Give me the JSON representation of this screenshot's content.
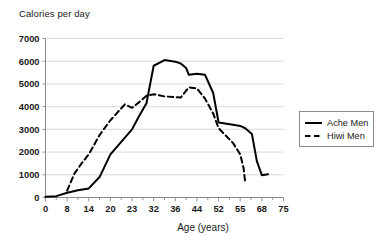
{
  "chart_data": {
    "type": "line",
    "title": "",
    "xlabel": "Age (years)",
    "ylabel": "Calories per day",
    "grid": true,
    "legend_position": "right",
    "ylim": [
      0,
      7000
    ],
    "ytick_step": 1000,
    "yticks": [
      "0",
      "1000",
      "2000",
      "3000",
      "4000",
      "5000",
      "6000",
      "7000"
    ],
    "categories": [
      "0",
      "8",
      "14",
      "20",
      "23",
      "32",
      "36",
      "44",
      "52",
      "55",
      "68",
      "75"
    ],
    "x": [
      0,
      4,
      6,
      8,
      10,
      12,
      14,
      16,
      18,
      20,
      23,
      26,
      29,
      32,
      34,
      36,
      38,
      40,
      41,
      44,
      47,
      50,
      52,
      54,
      55,
      58,
      60,
      64,
      68,
      70
    ],
    "series": [
      {
        "name": "Ache Men",
        "style": "solid",
        "color": "#000000",
        "x": [
          0,
          4,
          8,
          11,
          14,
          17,
          20,
          23,
          26,
          29,
          32,
          34,
          36,
          38,
          40,
          41,
          44,
          47,
          50,
          52,
          54,
          55,
          58,
          62,
          65,
          68,
          70
        ],
        "values": [
          30,
          60,
          210,
          320,
          400,
          900,
          1900,
          3000,
          3600,
          4150,
          5800,
          6050,
          5980,
          5900,
          5700,
          5400,
          5450,
          5400,
          4600,
          3300,
          3200,
          3150,
          3050,
          2800,
          1600,
          980,
          1020
        ]
      },
      {
        "name": "Hiwi Men",
        "style": "dashed",
        "color": "#000000",
        "x": [
          8,
          10,
          12,
          14,
          17,
          20,
          22,
          23,
          26,
          29,
          32,
          34,
          36,
          38,
          40,
          41,
          44,
          47,
          50,
          52,
          54,
          55,
          57,
          58
        ],
        "values": [
          300,
          1050,
          1500,
          1900,
          2750,
          3400,
          4100,
          3950,
          4200,
          4480,
          4550,
          4450,
          4420,
          4400,
          4700,
          4850,
          4800,
          4350,
          3700,
          3050,
          2400,
          1900,
          1300,
          650
        ]
      }
    ]
  },
  "legend": {
    "items": [
      {
        "label": "Ache Men",
        "style": "solid"
      },
      {
        "label": "Hiwi Men",
        "style": "dashed"
      }
    ]
  }
}
